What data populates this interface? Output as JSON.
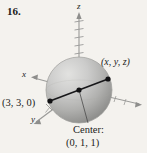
{
  "problem": {
    "number": "16."
  },
  "figure": {
    "type": "3d-sphere-diagram",
    "axes": [
      {
        "name": "z-axis",
        "label": "z",
        "direction": "up",
        "ticks": 7
      },
      {
        "name": "x-axis",
        "label": "x",
        "direction": "left"
      },
      {
        "name": "y-axis",
        "label": "y",
        "direction": "down-left"
      }
    ],
    "labels": {
      "point_on_sphere": "(x, y, z)",
      "opposite_point": "(3, 3, 0)",
      "center_caption": "Center:",
      "center_coords": "(0, 1, 1)"
    },
    "sphere": {
      "center_px": [
        79,
        90
      ],
      "radius_px": 33,
      "fill_light": "#d8d8d6",
      "fill_mid": "#b4b4b2",
      "fill_dark": "#8f8f8d"
    },
    "diameter_line": {
      "from": "(3, 3, 0)",
      "through": "Center: (0, 1, 1)",
      "to": "(x, y, z)",
      "color": "#17171a"
    },
    "colors": {
      "background": "#f4f2ee",
      "ink": "#1b1b1b",
      "axis": "#8e8e8c"
    }
  }
}
